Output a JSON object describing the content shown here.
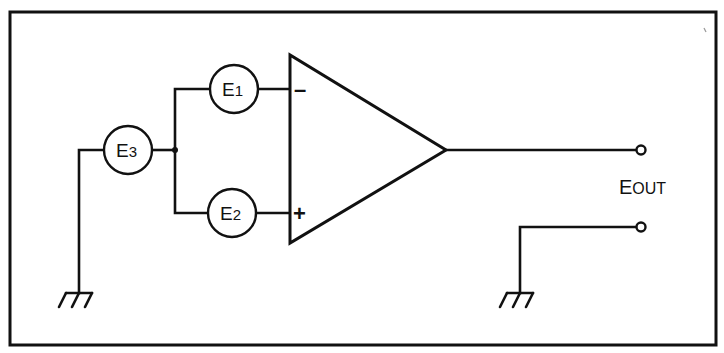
{
  "diagram": {
    "type": "op-amp circuit schematic",
    "sources": [
      {
        "id": "E1",
        "main": "E",
        "sub": "1",
        "connects_to": "inverting-input"
      },
      {
        "id": "E2",
        "main": "E",
        "sub": "2",
        "connects_to": "non-inverting-input"
      },
      {
        "id": "E3",
        "main": "E",
        "sub": "3",
        "connects_to": "ground"
      }
    ],
    "opamp": {
      "inverting_sign": "–",
      "noninverting_sign": "+"
    },
    "output": {
      "label_main": "E",
      "label_sub": "OUT"
    },
    "grounds": [
      "input-ground",
      "output-ground"
    ],
    "colors": {
      "line": "#111111",
      "background": "#ffffff"
    }
  }
}
